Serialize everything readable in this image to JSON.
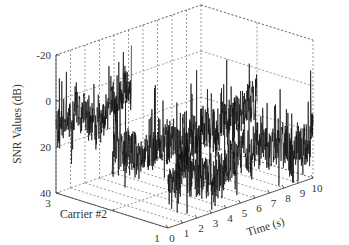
{
  "chart_data": {
    "type": "line3d",
    "title": "",
    "xlabel": "Time (s)",
    "ylabel": "Carrier #2",
    "zlabel": "SNR Values (dB)",
    "x_ticks": [
      "0",
      "1",
      "2",
      "3",
      "4",
      "5",
      "6",
      "7",
      "8",
      "9",
      "10"
    ],
    "y_ticks": [
      "1",
      "3"
    ],
    "z_ticks": [
      "-20",
      "0",
      "20",
      "40"
    ],
    "xlim": [
      0,
      10
    ],
    "ylim": [
      1,
      3
    ],
    "zlim": [
      -20,
      40
    ],
    "z_reversed": true,
    "grid": true,
    "series": [
      {
        "name": "Carrier 3",
        "carrier": 3,
        "x_range": [
          0,
          10
        ],
        "mean_snr": 12,
        "spread": 10,
        "visible_x_range": [
          0,
          5.2
        ]
      },
      {
        "name": "Carrier 2",
        "carrier": 2,
        "x_range": [
          0,
          10
        ],
        "mean_snr": 18,
        "spread": 12,
        "visible_x_range": [
          0,
          10
        ]
      },
      {
        "name": "Carrier 1",
        "carrier": 1,
        "x_range": [
          0,
          10
        ],
        "mean_snr": 22,
        "spread": 12,
        "visible_x_range": [
          0,
          10
        ]
      }
    ]
  },
  "labels": {
    "z_axis": "SNR Values (dB)",
    "y_axis": "Carrier #2",
    "x_axis": "Time (s)"
  }
}
